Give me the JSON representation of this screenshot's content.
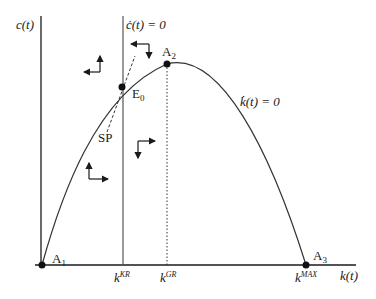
{
  "diagram": {
    "type": "phase-diagram",
    "axes": {
      "y_label": "c(t)",
      "x_label": "k(t)"
    },
    "curves": {
      "c_dot_locus": "ċ(t) = 0",
      "k_dot_locus": "k̇(t) = 0",
      "saddle_path": "SP"
    },
    "points": {
      "A1": "A",
      "A1_sub": "1",
      "A2": "A",
      "A2_sub": "2",
      "A3": "A",
      "A3_sub": "3",
      "E0": "E",
      "E0_sub": "0"
    },
    "x_ticks": [
      {
        "base": "k",
        "sup": "KR"
      },
      {
        "base": "k",
        "sup": "GR"
      },
      {
        "base": "k",
        "sup": "MAX"
      }
    ],
    "colors": {
      "line": "#1a1a1a",
      "curve": "#333333",
      "background": "#ffffff"
    }
  }
}
